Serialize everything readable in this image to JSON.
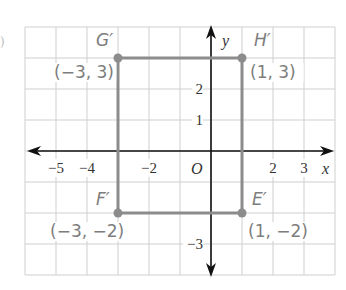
{
  "figure": {
    "type": "coordinate-plane",
    "grid": {
      "x_min": -6,
      "x_max": 4,
      "y_min": -4,
      "y_max": 4,
      "cell_px": 31,
      "origin_px": [
        211,
        151
      ]
    },
    "colors": {
      "grid": "#cfcfcf",
      "axes": "#111111",
      "shape": "#8c8c8c",
      "label": "#7d7d7d"
    },
    "axes": {
      "x_label": "x",
      "y_label": "y",
      "origin_label": "O"
    },
    "x_ticks": [
      {
        "value": -5,
        "label": "−5"
      },
      {
        "value": -4,
        "label": "−4"
      },
      {
        "value": -2,
        "label": "−2"
      },
      {
        "value": 2,
        "label": "2"
      },
      {
        "value": 3,
        "label": "3"
      }
    ],
    "y_ticks": [
      {
        "value": 2,
        "label": "2"
      },
      {
        "value": 1,
        "label": "1"
      },
      {
        "value": -3,
        "label": "−3"
      }
    ],
    "rectangle": {
      "vertices": [
        {
          "name": "G′",
          "coord_label": "(−3, 3)",
          "x": -3,
          "y": 3
        },
        {
          "name": "H′",
          "coord_label": "(1, 3)",
          "x": 1,
          "y": 3
        },
        {
          "name": "E′",
          "coord_label": "(1, −2)",
          "x": 1,
          "y": -2
        },
        {
          "name": "F′",
          "coord_label": "(−3, −2)",
          "x": -3,
          "y": -2
        }
      ]
    },
    "margin_mark": ")"
  }
}
